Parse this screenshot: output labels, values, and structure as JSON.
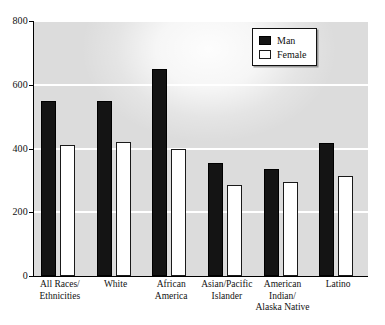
{
  "chart_data": {
    "type": "bar",
    "title": "",
    "subtitle": "",
    "xlabel": "",
    "ylabel": "",
    "ylim": [
      0,
      800
    ],
    "yticks": [
      0,
      200,
      400,
      600,
      800
    ],
    "ytick_labels": [
      "0",
      "200",
      "400",
      "600",
      "800"
    ],
    "grid": true,
    "grid_axis": "y",
    "legend_position": "top-right",
    "categories": [
      "All Races/\nEthnicities",
      "White",
      "African\nAmerica",
      "Asian/Pacific\nIslander",
      "American\nIndian/\nAlaska Native",
      "Latino"
    ],
    "category_lines": [
      [
        "All Races/",
        "Ethnicities"
      ],
      [
        "White"
      ],
      [
        "African",
        "America"
      ],
      [
        "Asian/Pacific",
        "Islander"
      ],
      [
        "American",
        "Indian/",
        "Alaska Native"
      ],
      [
        "Latino"
      ]
    ],
    "series": [
      {
        "name": "Man",
        "color": "#141414",
        "values": [
          550,
          550,
          650,
          355,
          335,
          418
        ]
      },
      {
        "name": "Female",
        "color": "#ffffff",
        "edge_color": "#1a1a1a",
        "values": [
          410,
          422,
          398,
          285,
          295,
          315
        ]
      }
    ]
  },
  "legend": {
    "items": [
      {
        "label": "Man",
        "swatch": "filled-black-square"
      },
      {
        "label": "Female",
        "swatch": "outlined-white-square"
      }
    ]
  },
  "colors": {
    "plot_background": "#dcdcdc",
    "gridline": "#ffffff",
    "axis": "#000000",
    "man_bar": "#141414",
    "female_bar": "#ffffff",
    "female_bar_border": "#1a1a1a",
    "page_background": "#ffffff",
    "text": "#111111"
  }
}
